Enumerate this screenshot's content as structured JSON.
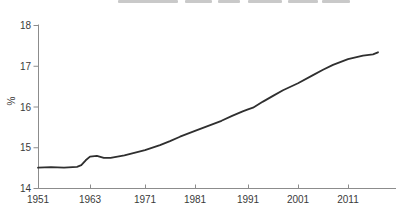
{
  "chart_data": {
    "type": "line",
    "title": "",
    "title_cropped_out_of_frame": true,
    "xlabel": "",
    "ylabel": "%",
    "x_tick_labels": [
      "1951",
      "1963",
      "1971",
      "1981",
      "1991",
      "2001",
      "2011"
    ],
    "x_tick_years": [
      1951,
      1963,
      1971,
      1981,
      1991,
      2001,
      2011
    ],
    "y_tick_labels": [
      "18",
      "17",
      "16",
      "15",
      "14"
    ],
    "y_tick_values": [
      18,
      17,
      16,
      15,
      14
    ],
    "ylim": [
      14,
      18
    ],
    "grid": false,
    "legend": null,
    "line_color": "#2f2f2f",
    "axis_color": "#8c8c8c",
    "text_color": "#3a3a3a",
    "series": [
      {
        "name": "percent",
        "points": [
          [
            1951,
            14.5
          ],
          [
            1954,
            14.51
          ],
          [
            1957,
            14.5
          ],
          [
            1960,
            14.52
          ],
          [
            1961,
            14.56
          ],
          [
            1962,
            14.68
          ],
          [
            1963,
            14.77
          ],
          [
            1964,
            14.79
          ],
          [
            1965,
            14.74
          ],
          [
            1966,
            14.74
          ],
          [
            1968,
            14.8
          ],
          [
            1971,
            14.93
          ],
          [
            1974,
            15.05
          ],
          [
            1976,
            15.15
          ],
          [
            1978,
            15.26
          ],
          [
            1981,
            15.4
          ],
          [
            1984,
            15.55
          ],
          [
            1986,
            15.65
          ],
          [
            1988,
            15.77
          ],
          [
            1990,
            15.88
          ],
          [
            1991,
            15.93
          ],
          [
            1992,
            15.97
          ],
          [
            1994,
            16.12
          ],
          [
            1996,
            16.26
          ],
          [
            1998,
            16.4
          ],
          [
            2001,
            16.57
          ],
          [
            2004,
            16.77
          ],
          [
            2006,
            16.9
          ],
          [
            2008,
            17.02
          ],
          [
            2011,
            17.16
          ],
          [
            2014,
            17.25
          ],
          [
            2016,
            17.28
          ],
          [
            2017,
            17.33
          ]
        ]
      }
    ]
  }
}
